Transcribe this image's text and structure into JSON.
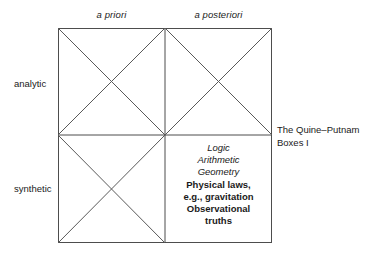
{
  "figure": {
    "caption_lines": [
      "The Quine–Putnam",
      "Boxes I"
    ],
    "caption_full": "The Quine–Putnam Boxes I",
    "line_color": "#4d4d4d",
    "text_color": "#1a1a1a",
    "background": "#ffffff"
  },
  "columns": [
    {
      "label": "a priori"
    },
    {
      "label": "a posteriori"
    }
  ],
  "rows": [
    {
      "label": "analytic"
    },
    {
      "label": "synthetic"
    }
  ],
  "cells": [
    {
      "row": "analytic",
      "column": "a priori",
      "crossed_out": true,
      "lines": []
    },
    {
      "row": "analytic",
      "column": "a posteriori",
      "crossed_out": true,
      "lines": []
    },
    {
      "row": "synthetic",
      "column": "a priori",
      "crossed_out": true,
      "lines": []
    },
    {
      "row": "synthetic",
      "column": "a posteriori",
      "crossed_out": false,
      "lines": [
        {
          "text": "Logic",
          "style": "italic"
        },
        {
          "text": "Arithmetic",
          "style": "italic"
        },
        {
          "text": "Geometry",
          "style": "italic"
        },
        {
          "text": "Physical laws,",
          "style": "bold"
        },
        {
          "text": "e.g., gravitation",
          "style": "bold"
        },
        {
          "text": "Observational",
          "style": "bold"
        },
        {
          "text": "truths",
          "style": "bold"
        }
      ]
    }
  ]
}
